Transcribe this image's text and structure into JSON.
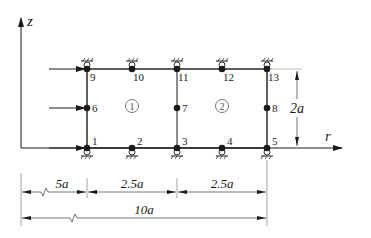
{
  "figure": {
    "axes": {
      "vertical_label": "z",
      "horizontal_label": "r"
    },
    "nodes": [
      {
        "id": "1",
        "col": 0,
        "row": 0
      },
      {
        "id": "2",
        "col": 1,
        "row": 0
      },
      {
        "id": "3",
        "col": 2,
        "row": 0
      },
      {
        "id": "4",
        "col": 3,
        "row": 0
      },
      {
        "id": "5",
        "col": 4,
        "row": 0
      },
      {
        "id": "6",
        "col": 0,
        "row": 1
      },
      {
        "id": "7",
        "col": 2,
        "row": 1
      },
      {
        "id": "8",
        "col": 4,
        "row": 1
      },
      {
        "id": "9",
        "col": 0,
        "row": 2
      },
      {
        "id": "10",
        "col": 1,
        "row": 2
      },
      {
        "id": "11",
        "col": 2,
        "row": 2
      },
      {
        "id": "12",
        "col": 3,
        "row": 2
      },
      {
        "id": "13",
        "col": 4,
        "row": 2
      }
    ],
    "elements": [
      {
        "label": "①",
        "number": 1
      },
      {
        "label": "②",
        "number": 2
      }
    ],
    "loads": [
      {
        "at_node": "9",
        "direction": "+r"
      },
      {
        "at_node": "6",
        "direction": "+r"
      },
      {
        "at_node": "1",
        "direction": "+r"
      }
    ],
    "supports": {
      "top_row_nodes": [
        "9",
        "10",
        "11",
        "12",
        "13"
      ],
      "bottom_row_nodes": [
        "1",
        "2",
        "3",
        "4",
        "5"
      ],
      "type": "roller"
    },
    "dimensions": {
      "height": "2a",
      "offset": "5a",
      "element1_width": "2.5a",
      "element2_width": "2.5a",
      "total": "10a"
    },
    "colors": {
      "line": "#1a1a1a",
      "background": "#ffffff"
    }
  }
}
